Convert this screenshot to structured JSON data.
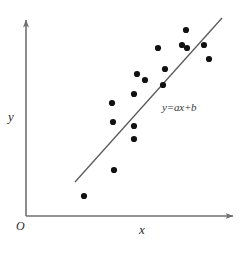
{
  "figure": {
    "background_color": "#ffffff",
    "axis_color": "#6f6f6f",
    "point_color": "#111111",
    "line_color": "#5a5a5a",
    "width": 245,
    "height": 254
  },
  "labels": {
    "y_axis": "y",
    "x_axis": "x",
    "origin": "O",
    "line_equation": "y=ax+b",
    "top_cut_text": "",
    "bottom_caption": ""
  },
  "chart_data": {
    "type": "scatter",
    "title": "",
    "xlabel": "x",
    "ylabel": "y",
    "grid": false,
    "legend": "none",
    "annotations": [
      {
        "text": "y=ax+b",
        "x": 162,
        "y": 101,
        "kind": "line-equation"
      },
      {
        "text": "O",
        "x": 16,
        "y": 219,
        "kind": "origin"
      }
    ],
    "axes": {
      "origin_px": [
        26,
        216
      ],
      "x_axis_px": [
        [
          26,
          216
        ],
        [
          236,
          216
        ]
      ],
      "y_axis_px": [
        [
          26,
          216
        ],
        [
          26,
          16
        ]
      ],
      "arrow_heads": [
        "x-positive",
        "y-positive"
      ],
      "tick_labels_x": [],
      "tick_labels_y": [],
      "xlim": [
        0,
        1
      ],
      "ylim": [
        0,
        1
      ]
    },
    "trendline": {
      "label": "y=ax+b",
      "start_px": [
        75,
        182
      ],
      "end_px": [
        222,
        18
      ],
      "slope_sign": "positive"
    },
    "points_px": [
      [
        84,
        196
      ],
      [
        114,
        170
      ],
      [
        113,
        122
      ],
      [
        112,
        103
      ],
      [
        134,
        139
      ],
      [
        134,
        126
      ],
      [
        134,
        94
      ],
      [
        137,
        74
      ],
      [
        145,
        80
      ],
      [
        158,
        48
      ],
      [
        163,
        85
      ],
      [
        165,
        69
      ],
      [
        182,
        45
      ],
      [
        186,
        30
      ],
      [
        187,
        48
      ],
      [
        204,
        45
      ],
      [
        209,
        59
      ]
    ],
    "points_normalized": [
      [
        0.276,
        0.1
      ],
      [
        0.419,
        0.23
      ],
      [
        0.414,
        0.47
      ],
      [
        0.41,
        0.565
      ],
      [
        0.514,
        0.385
      ],
      [
        0.514,
        0.45
      ],
      [
        0.514,
        0.61
      ],
      [
        0.529,
        0.71
      ],
      [
        0.567,
        0.68
      ],
      [
        0.629,
        0.84
      ],
      [
        0.652,
        0.655
      ],
      [
        0.662,
        0.735
      ],
      [
        0.743,
        0.855
      ],
      [
        0.762,
        0.93
      ],
      [
        0.767,
        0.84
      ],
      [
        0.848,
        0.855
      ],
      [
        0.871,
        0.785
      ]
    ],
    "point_count": 17
  }
}
